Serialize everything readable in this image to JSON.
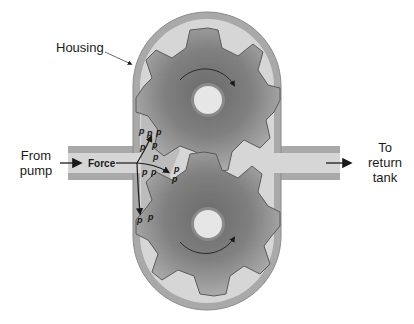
{
  "labels": {
    "housing": "Housing",
    "inlet_line1": "From",
    "inlet_line2": "pump",
    "outlet_line1": "To",
    "outlet_line2": "return",
    "outlet_line3": "tank",
    "force": "Force",
    "pressure_symbol": "p"
  },
  "components": {
    "housing": "pump housing (stadium shape)",
    "upper_gear": {
      "teeth": 9,
      "rotation": "clockwise"
    },
    "lower_gear": {
      "teeth": 9,
      "rotation": "counterclockwise"
    },
    "inlet_port": "left",
    "outlet_port": "right"
  },
  "colors": {
    "housing_wall": "#a9a9a9",
    "housing_interior": "#d6d6d6",
    "gear_dark": "#6e6e6e",
    "gear_light": "#a8a8a8",
    "hub": "#e6e6e6",
    "fluid_pocket": "#b5b5b5",
    "text": "#1a1a1a"
  }
}
